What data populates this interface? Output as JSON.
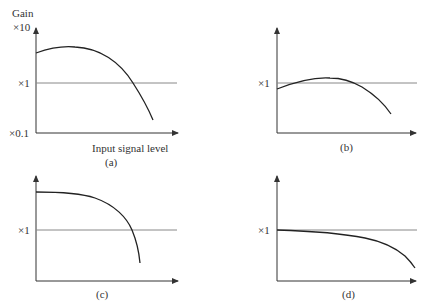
{
  "figure": {
    "y_axis_title": "Gain",
    "x_axis_title": "Input signal level",
    "tick_labels": {
      "top": "×10",
      "unity": "×1",
      "bottom": "×0.1"
    },
    "panels": [
      {
        "id": "a",
        "caption": "(a)",
        "description": "Gain rises above unity, peaks, then falls steeply below ×1 at high input"
      },
      {
        "id": "b",
        "caption": "(b)",
        "description": "Gain starts just below ×1, rises slightly above, then falls off"
      },
      {
        "id": "c",
        "caption": "(c)",
        "description": "High flat gain then sharp drop through ×1"
      },
      {
        "id": "d",
        "caption": "(d)",
        "description": "Gain near ×1 staying flat, slowly decreasing then dropping at high input"
      }
    ]
  },
  "colors": {
    "axis": "#333333",
    "unity_line": "#888888",
    "curve": "#222222"
  }
}
